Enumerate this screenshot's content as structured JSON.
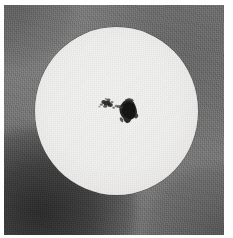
{
  "image": {
    "subject": "solar-disk-photograph",
    "description": "Black-and-white photograph of the full solar disk showing a large sunspot group near disk centre",
    "medium": "grayscale photographic print",
    "border_color": "#fefefe",
    "background_color": "#707070",
    "disk_color": "#f1f1f0",
    "sunspot_color": "#1a1a1a"
  },
  "solar_disk": {
    "label": "solar-disk",
    "center_x": 116,
    "center_y": 112,
    "radius_px": 82,
    "limb_darkening": "true"
  },
  "sunspot_group": {
    "label": "sunspot-group",
    "members": [
      {
        "name": "leader-spot",
        "role": "leading umbra with penumbra",
        "center_x": 127,
        "center_y": 112,
        "width_px": 16,
        "height_px": 18
      },
      {
        "name": "follower-spot",
        "role": "trailing fragmented umbrae",
        "center_x": 106,
        "center_y": 108,
        "width_px": 14,
        "height_px": 9
      },
      {
        "name": "connecting-pores",
        "role": "bridge of small pores between leader and follower",
        "center_x": 117,
        "center_y": 110,
        "width_px": 12,
        "height_px": 6
      }
    ]
  },
  "artifacts": {
    "vignette_bottom_left": "dark corner blotch",
    "vignette_bottom_right": "faint dark corner",
    "vignette_top_left": "faint dark corner",
    "film_grain": "visible"
  }
}
